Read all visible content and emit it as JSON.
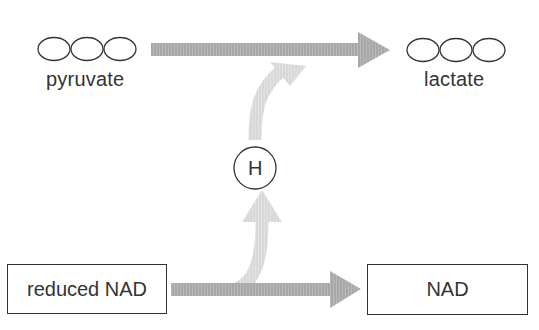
{
  "diagram": {
    "molecules": {
      "pyruvate": {
        "label": "pyruvate",
        "carbon_count": 3
      },
      "lactate": {
        "label": "lactate",
        "carbon_count": 3
      }
    },
    "hydrogen": {
      "label": "H"
    },
    "boxes": {
      "reduced_nad": {
        "label": "reduced NAD"
      },
      "nad": {
        "label": "NAD"
      }
    },
    "arrows": [
      {
        "from": "pyruvate",
        "to": "lactate",
        "color": "#a9a9a9"
      },
      {
        "from": "reduced NAD",
        "to": "NAD",
        "color": "#a9a9a9"
      },
      {
        "from": "reduced NAD",
        "to": "lactate",
        "via": "H",
        "color": "#d9d9d9"
      }
    ]
  }
}
